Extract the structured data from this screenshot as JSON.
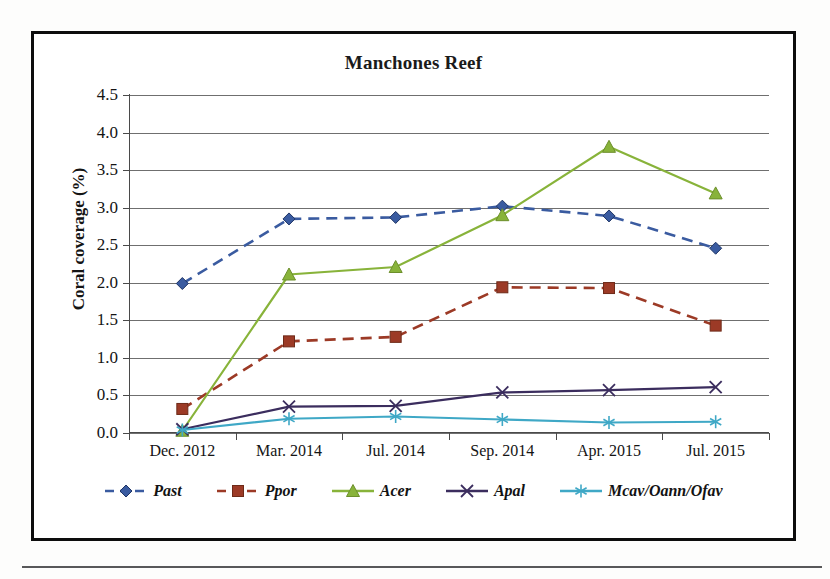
{
  "figure": {
    "title": "Manchones Reef"
  },
  "chart_data": {
    "type": "line",
    "title": "Manchones Reef",
    "xlabel": "",
    "ylabel": "Coral coverage (%)",
    "categories": [
      "Dec. 2012",
      "Mar. 2014",
      "Jul. 2014",
      "Sep. 2014",
      "Apr. 2015",
      "Jul. 2015"
    ],
    "ylim": [
      0.0,
      4.5
    ],
    "ytick_labels": [
      "0.0",
      "0.5",
      "1.0",
      "1.5",
      "2.0",
      "2.5",
      "3.0",
      "3.5",
      "4.0",
      "4.5"
    ],
    "ytick_values": [
      0.0,
      0.5,
      1.0,
      1.5,
      2.0,
      2.5,
      3.0,
      3.5,
      4.0,
      4.5
    ],
    "grid": true,
    "legend_position": "bottom",
    "series": [
      {
        "name": "Past",
        "values": [
          1.99,
          2.85,
          2.87,
          3.02,
          2.89,
          2.46
        ],
        "color": "#3a5ba0",
        "marker": "diamond",
        "line_style": "dashed"
      },
      {
        "name": "Ppor",
        "values": [
          0.32,
          1.22,
          1.28,
          1.94,
          1.93,
          1.43
        ],
        "color": "#9c3a26",
        "marker": "square",
        "line_style": "dashed"
      },
      {
        "name": "Acer",
        "values": [
          0.03,
          2.11,
          2.21,
          2.9,
          3.81,
          3.19
        ],
        "color": "#88b33a",
        "marker": "triangle",
        "line_style": "solid"
      },
      {
        "name": "Apal",
        "values": [
          0.05,
          0.35,
          0.36,
          0.54,
          0.57,
          0.61
        ],
        "color": "#3b2d5e",
        "marker": "x",
        "line_style": "solid"
      },
      {
        "name": "Mcav/Oann/Ofav",
        "values": [
          0.04,
          0.19,
          0.22,
          0.18,
          0.14,
          0.15
        ],
        "color": "#3fa8c6",
        "marker": "star",
        "line_style": "solid"
      }
    ]
  }
}
